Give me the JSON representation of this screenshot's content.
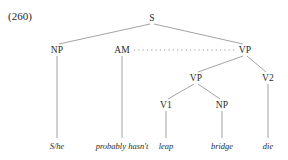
{
  "figure": {
    "example_number": "(260)",
    "kind": "syntax-tree",
    "sentence": "S/he probably hasn't leap bridge die"
  },
  "nodes": {
    "s": {
      "label": "S",
      "x": 152,
      "y": 18
    },
    "np_subject": {
      "label": "NP",
      "x": 57,
      "y": 50
    },
    "am": {
      "label": "AM",
      "x": 122,
      "y": 50
    },
    "vp_upper": {
      "label": "VP",
      "x": 245,
      "y": 50
    },
    "vp_lower": {
      "label": "VP",
      "x": 196,
      "y": 78
    },
    "v2": {
      "label": "V2",
      "x": 268,
      "y": 78
    },
    "v1": {
      "label": "V1",
      "x": 166,
      "y": 105
    },
    "np_object": {
      "label": "NP",
      "x": 222,
      "y": 105
    }
  },
  "terminals": [
    {
      "label": "S/he",
      "x": 57,
      "y": 146
    },
    {
      "label": "probably hasn't",
      "x": 122,
      "y": 146
    },
    {
      "label": "leap",
      "x": 166,
      "y": 146
    },
    {
      "label": "bridge",
      "x": 222,
      "y": 146
    },
    {
      "label": "die",
      "x": 268,
      "y": 146
    }
  ],
  "edges": {
    "solid_color": "#8c8c8c",
    "dotted_color": "#8c8c8c"
  }
}
